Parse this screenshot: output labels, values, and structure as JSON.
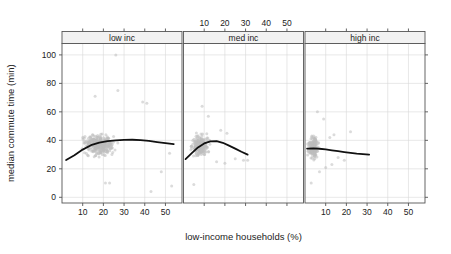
{
  "chart_data": {
    "type": "scatter",
    "title": "",
    "xlabel": "low-income households (%)",
    "ylabel": "median commute time (min)",
    "xlim": [
      0,
      58
    ],
    "ylim": [
      -4,
      108
    ],
    "xticks": [
      10,
      20,
      30,
      40,
      50
    ],
    "yticks": [
      0,
      20,
      40,
      60,
      80,
      100
    ],
    "xtick_labels": [
      "10",
      "20",
      "30",
      "40",
      "50"
    ],
    "ytick_labels": [
      "0",
      "20",
      "40",
      "60",
      "80",
      "100"
    ],
    "grid": true,
    "legend": "none",
    "layout": "trellis 1 row x 3 columns, shared axes, alternating top/bottom x-axis labelling",
    "point_color": "#bdbdbd",
    "trend_color": "#111111",
    "strip_fill": "#f2f2f2",
    "grid_color": "#d9d9d9",
    "axis_color": "#555555",
    "panels": [
      {
        "label": "low inc",
        "x_axis_position": "bottom",
        "n_points": 320,
        "cloud": {
          "x_center": 18,
          "y_center": 37,
          "x_spread": 9,
          "y_spread": 8,
          "x_min": 2,
          "x_max": 55,
          "y_min": 4,
          "y_max": 100
        },
        "trend": {
          "x": [
            2,
            6,
            10,
            14,
            18,
            22,
            26,
            30,
            34,
            38,
            42,
            46,
            50,
            54
          ],
          "y": [
            26.2,
            29.5,
            33.5,
            36.6,
            38.4,
            39.4,
            40.0,
            40.3,
            40.4,
            40.2,
            39.6,
            38.8,
            38.0,
            37.3
          ]
        },
        "outliers": [
          {
            "x": 26,
            "y": 100
          },
          {
            "x": 27,
            "y": 75
          },
          {
            "x": 16,
            "y": 71
          },
          {
            "x": 39,
            "y": 67
          },
          {
            "x": 41,
            "y": 66
          },
          {
            "x": 43,
            "y": 4
          },
          {
            "x": 53,
            "y": 8
          },
          {
            "x": 48,
            "y": 18
          },
          {
            "x": 21,
            "y": 10
          },
          {
            "x": 23,
            "y": 10
          },
          {
            "x": 52,
            "y": 31
          }
        ]
      },
      {
        "label": "med inc",
        "x_axis_position": "top",
        "n_points": 250,
        "cloud": {
          "x_center": 8,
          "y_center": 36,
          "x_spread": 5,
          "y_spread": 8,
          "x_min": 1,
          "x_max": 34,
          "y_min": 9,
          "y_max": 65
        },
        "trend": {
          "x": [
            1,
            4,
            7,
            10,
            13,
            16,
            19,
            22,
            25,
            28,
            31
          ],
          "y": [
            26.8,
            31.0,
            35.0,
            37.8,
            39.3,
            39.5,
            38.3,
            36.3,
            34.2,
            32.0,
            30.0
          ]
        },
        "outliers": [
          {
            "x": 9,
            "y": 64
          },
          {
            "x": 12,
            "y": 57
          },
          {
            "x": 18,
            "y": 47
          },
          {
            "x": 21,
            "y": 45
          },
          {
            "x": 25,
            "y": 27
          },
          {
            "x": 29,
            "y": 26
          },
          {
            "x": 31,
            "y": 26
          },
          {
            "x": 16,
            "y": 25
          },
          {
            "x": 20,
            "y": 24
          },
          {
            "x": 5,
            "y": 9
          }
        ]
      },
      {
        "label": "high inc",
        "x_axis_position": "bottom",
        "n_points": 170,
        "cloud": {
          "x_center": 4,
          "y_center": 35,
          "x_spread": 3,
          "y_spread": 8,
          "x_min": 0.5,
          "x_max": 20,
          "y_min": 10,
          "y_max": 60
        },
        "trend": {
          "x": [
            1,
            4,
            7,
            10,
            13,
            16,
            19,
            22,
            25,
            28,
            31
          ],
          "y": [
            34.2,
            34.3,
            34.1,
            33.6,
            33.0,
            32.4,
            31.8,
            31.2,
            30.7,
            30.3,
            29.9
          ]
        },
        "outliers": [
          {
            "x": 6,
            "y": 60
          },
          {
            "x": 9,
            "y": 55
          },
          {
            "x": 22,
            "y": 46
          },
          {
            "x": 14,
            "y": 44
          },
          {
            "x": 12,
            "y": 42
          },
          {
            "x": 16,
            "y": 28
          },
          {
            "x": 19,
            "y": 26
          },
          {
            "x": 13,
            "y": 23
          },
          {
            "x": 10,
            "y": 21
          },
          {
            "x": 3,
            "y": 10
          },
          {
            "x": 7,
            "y": 18
          }
        ]
      }
    ]
  }
}
